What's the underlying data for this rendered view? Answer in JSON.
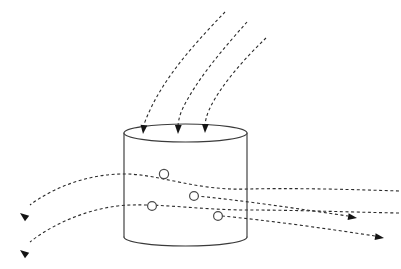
{
  "figure": {
    "background_color": "#ffffff",
    "width": 401,
    "height": 269
  },
  "style": {
    "outline_color": "#3a3a3a",
    "flow_color": "#2b2b2b",
    "arrow_color": "#141414",
    "particle_stroke_color": "#4a4a4a",
    "particle_fill_color": "#ffffff",
    "dash_pattern": "3 2.6",
    "outline_stroke_width": 1.15,
    "flow_stroke_width": 1.1
  },
  "vessel": {
    "name": "cylinder",
    "center_x": 185.5,
    "left_x": 124,
    "right_x": 247,
    "top_y": 133,
    "bottom_y": 237,
    "ellipse_ry": 9,
    "bottom_bulge_y": 244,
    "top_path": "M 124 133 A 61.5 9 0 0 0 247 133 A 61.5 9 0 0 0 124 133 Z",
    "left_wall_path": "M 124 133 L 124 237",
    "right_wall_path": "M 247 133 L 247 237",
    "bottom_path": "M 124 237 A 61.5 9 0 0 0 247 237"
  },
  "incoming_streams": [
    {
      "name": "incoming-stream-1",
      "path": "M 225 12 C 200 38 168 72 151 108 C 146 118 144 124 143 129",
      "arrow_tip_x": 143,
      "arrow_tip_y": 134,
      "arrow_angle_deg": 96
    },
    {
      "name": "incoming-stream-2",
      "path": "M 247 22 C 224 48 196 80 182 110 C 179 117 178 123 178 128",
      "arrow_tip_x": 178,
      "arrow_tip_y": 134,
      "arrow_angle_deg": 92
    },
    {
      "name": "incoming-stream-3",
      "path": "M 266 38 C 245 58 220 86 209 110 C 206 117 205 123 205 127",
      "arrow_tip_x": 205,
      "arrow_tip_y": 133,
      "arrow_angle_deg": 92
    }
  ],
  "through_streams": [
    {
      "name": "through-stream-upper",
      "path": "M 399 191 C 340 189 290 188 247 189 C 200 191 160 175 128 174 C 92 173 55 186 30 205",
      "arrow_tip_x": 20,
      "arrow_tip_y": 213,
      "arrow_angle_deg": 218,
      "exit_side": "left"
    },
    {
      "name": "through-stream-lower",
      "path": "M 399 213 C 345 212 295 210 247 210 C 205 210 165 204 130 205 C 95 206 55 222 30 242",
      "arrow_tip_x": 20,
      "arrow_tip_y": 250,
      "arrow_angle_deg": 218,
      "exit_side": "left"
    },
    {
      "name": "exit-stream-right-upper",
      "path": "M 196 196 C 240 200 300 209 348 216",
      "arrow_tip_x": 357,
      "arrow_tip_y": 218,
      "arrow_angle_deg": 9,
      "exit_side": "right"
    },
    {
      "name": "exit-stream-right-lower",
      "path": "M 222 216 C 265 220 330 229 375 236",
      "arrow_tip_x": 384,
      "arrow_tip_y": 238,
      "arrow_angle_deg": 9,
      "exit_side": "right"
    }
  ],
  "particles": [
    {
      "name": "particle-1",
      "cx": 164,
      "cy": 174,
      "r": 4.6
    },
    {
      "name": "particle-2",
      "cx": 152,
      "cy": 206,
      "r": 4.4
    },
    {
      "name": "particle-3",
      "cx": 194,
      "cy": 196,
      "r": 4.4
    },
    {
      "name": "particle-4",
      "cx": 218,
      "cy": 216,
      "r": 4.4
    }
  ]
}
